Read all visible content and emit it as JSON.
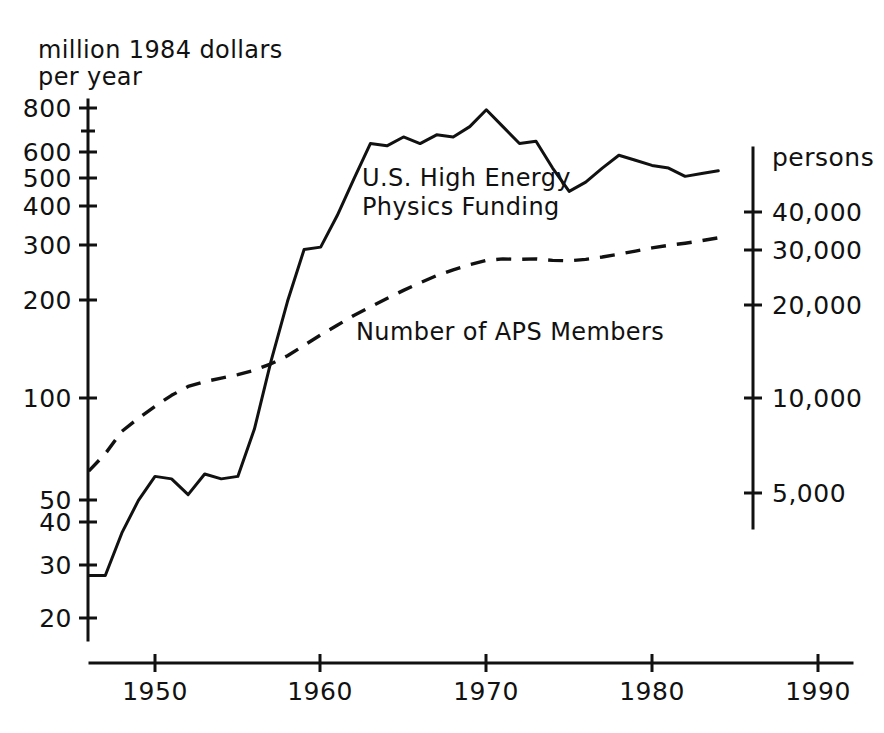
{
  "chart_data": {
    "type": "line",
    "title": "",
    "xlabel": "",
    "ylabel": "million 1984 dollars per year",
    "ylabel_line1": "million 1984 dollars",
    "ylabel_line2": "per year",
    "y2label": "persons",
    "xlim": [
      1946,
      1990
    ],
    "ylim": [
      18,
      900
    ],
    "y2lim": [
      3800,
      48000
    ],
    "yscale": "log",
    "y2scale": "log",
    "grid": false,
    "legend_position": "inline-annotations",
    "xticks": [
      1950,
      1960,
      1970,
      1980,
      1990
    ],
    "xtick_labels": [
      "1950",
      "1960",
      "1970",
      "1980",
      "1990"
    ],
    "yticks": [
      20,
      30,
      40,
      50,
      100,
      200,
      300,
      400,
      500,
      600,
      800
    ],
    "ytick_labels": [
      "20",
      "30",
      "40",
      "50",
      "100",
      "200",
      "300",
      "400",
      "500",
      "600",
      "800"
    ],
    "yticks_minor": [
      700
    ],
    "y2ticks": [
      5000,
      10000,
      20000,
      30000,
      40000
    ],
    "y2tick_labels": [
      "5,000",
      "10,000",
      "20,000",
      "30,000",
      "40,000"
    ],
    "series": [
      {
        "name": "U.S. High Energy Physics Funding",
        "label_line1": "U.S. High Energy",
        "label_line2": "Physics Funding",
        "style": "solid",
        "axis": "left",
        "units": "million 1984 dollars per year",
        "x": [
          1946,
          1947,
          1948,
          1949,
          1950,
          1951,
          1952,
          1953,
          1954,
          1955,
          1956,
          1957,
          1958,
          1959,
          1960,
          1961,
          1962,
          1963,
          1964,
          1965,
          1966,
          1967,
          1968,
          1969,
          1970,
          1971,
          1972,
          1973,
          1974,
          1975,
          1976,
          1977,
          1978,
          1979,
          1980,
          1981,
          1982,
          1983,
          1984
        ],
        "values": [
          28,
          28,
          38,
          48,
          57,
          56,
          50,
          58,
          56,
          57,
          80,
          130,
          200,
          290,
          295,
          370,
          480,
          620,
          610,
          650,
          620,
          660,
          650,
          700,
          790,
          700,
          620,
          630,
          520,
          440,
          470,
          520,
          570,
          550,
          530,
          520,
          490,
          500,
          510
        ]
      },
      {
        "name": "Number of APS Members",
        "label_line1": "Number of APS Members",
        "style": "dashed",
        "axis": "right",
        "units": "persons",
        "x": [
          1946,
          1947,
          1948,
          1949,
          1950,
          1951,
          1952,
          1953,
          1954,
          1955,
          1956,
          1957,
          1958,
          1959,
          1960,
          1961,
          1962,
          1963,
          1964,
          1965,
          1966,
          1967,
          1968,
          1969,
          1970,
          1971,
          1972,
          1973,
          1974,
          1975,
          1976,
          1977,
          1978,
          1979,
          1980,
          1981,
          1982,
          1983,
          1984
        ],
        "values": [
          5800,
          6600,
          7800,
          8600,
          9400,
          10200,
          10900,
          11300,
          11600,
          11900,
          12300,
          12900,
          13700,
          14800,
          16000,
          17200,
          18500,
          19700,
          21000,
          22300,
          23600,
          24900,
          26000,
          27000,
          27900,
          28200,
          28100,
          28200,
          27900,
          27800,
          28100,
          28600,
          29200,
          29900,
          30600,
          31200,
          31700,
          32300,
          33000
        ]
      }
    ],
    "annotations": [
      {
        "text": "U.S. High Energy Physics Funding",
        "x": 1964,
        "y": 420
      },
      {
        "text": "Number of APS Members",
        "x": 1966,
        "y": 170
      }
    ]
  }
}
